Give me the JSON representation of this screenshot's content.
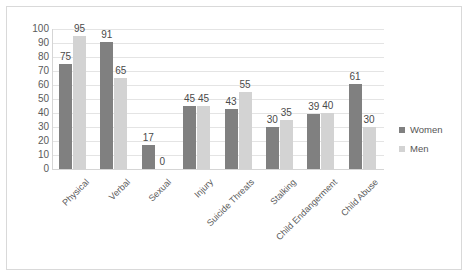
{
  "chart_data": {
    "type": "bar",
    "title": "",
    "xlabel": "",
    "ylabel": "",
    "ylim": [
      0,
      100
    ],
    "ytick_step": 10,
    "yticks": [
      100,
      90,
      80,
      70,
      60,
      50,
      40,
      30,
      20,
      10,
      0
    ],
    "grid": true,
    "legend_position": "right",
    "categories": [
      "Physical",
      "Verbal",
      "Sexual",
      "Injury",
      "Suicide Threats",
      "Stalking",
      "Child Endangerment",
      "Child Abuse"
    ],
    "series": [
      {
        "name": "Women",
        "color": "#808080",
        "values": [
          75,
          91,
          17,
          45,
          43,
          30,
          39,
          61
        ]
      },
      {
        "name": "Men",
        "color": "#d3d3d3",
        "values": [
          95,
          65,
          0,
          45,
          55,
          35,
          40,
          30
        ]
      }
    ]
  },
  "legend": {
    "items": [
      {
        "label": "Women",
        "color": "#808080",
        "marker": "square-marker"
      },
      {
        "label": "Men",
        "color": "#d3d3d3",
        "marker": "square-marker"
      }
    ]
  }
}
